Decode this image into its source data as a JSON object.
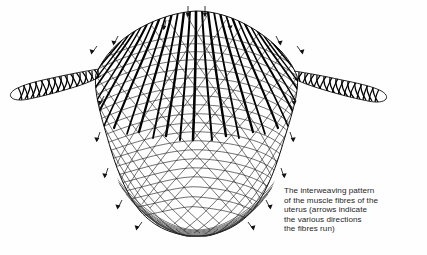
{
  "figure": {
    "ink_color": "#000000",
    "background_color": "#fefefe",
    "subject": "uterus",
    "parts": [
      {
        "name": "fundus",
        "label": "dome-shaped upper body"
      },
      {
        "name": "corpus",
        "label": "tapering mid body"
      },
      {
        "name": "cervix",
        "label": "rounded base"
      },
      {
        "name": "left-horn",
        "label": "left fallopian tube"
      },
      {
        "name": "right-horn",
        "label": "right fallopian tube"
      }
    ],
    "arrow_count": 18,
    "arrow_meaning": "direction the muscle fibres run"
  },
  "caption": {
    "text": "The interweaving pattern\nof the muscle fibres of the\nuterus (arrows indicate\nthe various directions\nthe fibres run)",
    "lines": [
      "The interweaving pattern",
      "of the muscle fibres of the",
      "uterus (arrows indicate",
      "the various directions",
      "the fibres run)"
    ]
  }
}
